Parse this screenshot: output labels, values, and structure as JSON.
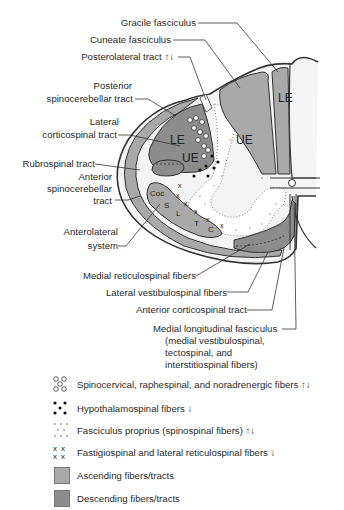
{
  "labels": {
    "gracile": "Gracile fasciculus",
    "cuneate": "Cuneate fasciculus",
    "posterolateral": "Posterolateral tract",
    "posterior_sc_1": "Posterior",
    "posterior_sc_2": "spinocerebellar tract",
    "lateral_cs_1": "Lateral",
    "lateral_cs_2": "corticospinal tract",
    "rubrospinal": "Rubrospinal tract",
    "anterior_sc_1": "Anterior",
    "anterior_sc_2": "spinocerebellar",
    "anterior_sc_3": "tract",
    "anterolateral_1": "Anterolateral",
    "anterolateral_2": "system",
    "medial_reticulospinal": "Medial reticulospinal fibers",
    "lateral_vestibulospinal": "Lateral vestibulospinal fibers",
    "anterior_corticospinal": "Anterior corticospinal tract",
    "mlf_1": "Medial longitudinal fasciculus",
    "mlf_2": "(medial vestibulospinal,",
    "mlf_3": "tectospinal, and",
    "mlf_4": "interstitiospinal fibers)"
  },
  "region_marks": {
    "gracile_le": "LE",
    "cuneate_ue": "UE",
    "lcs_le": "LE",
    "lcs_ue": "UE",
    "als_coc": "Coc",
    "als_s": "S",
    "als_l": "L",
    "als_t": "T",
    "als_c": "C"
  },
  "arrows": {
    "both": "↑↓",
    "down": "↓"
  },
  "legend": [
    {
      "symbol": "open-circles",
      "text": "Spinocervical, raphespinal, and noradrenergic fibers",
      "direction": "↑↓"
    },
    {
      "symbol": "filled-dots",
      "text": "Hypothalamospinal fibers",
      "direction": "↓"
    },
    {
      "symbol": "fine-dots",
      "text": "Fasciculus proprius (spinospinal fibers)",
      "direction": "↑↓"
    },
    {
      "symbol": "x-marks",
      "text": "Fastigiospinal and lateral reticulospinal fibers",
      "direction": "↓"
    },
    {
      "symbol": "light-gray-swatch",
      "text": "Ascending fibers/tracts",
      "direction": ""
    },
    {
      "symbol": "dark-gray-swatch",
      "text": "Descending fibers/tracts",
      "direction": ""
    }
  ],
  "colors": {
    "ascending": "#a9a9a9",
    "descending": "#8c8c8c",
    "outline": "#333333",
    "background": "#ffffff"
  }
}
